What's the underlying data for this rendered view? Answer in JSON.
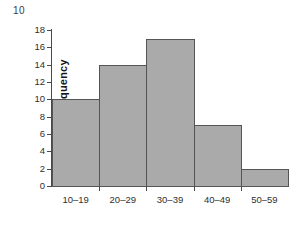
{
  "figure": {
    "number_label": "10",
    "background_color": "#ffffff"
  },
  "chart_data": {
    "type": "bar",
    "title": "",
    "subtitle": "",
    "xlabel": "",
    "ylabel": "Frequency",
    "categories": [
      "10–19",
      "20–29",
      "30–39",
      "40–49",
      "50–59"
    ],
    "values": [
      10,
      14,
      17,
      7,
      2
    ],
    "ylim": [
      0,
      18
    ],
    "yticks": [
      0,
      2,
      4,
      6,
      8,
      10,
      12,
      14,
      16,
      18
    ],
    "ytick_labels": [
      "0",
      "2",
      "4",
      "6",
      "8",
      "10",
      "12",
      "14",
      "16",
      "18"
    ],
    "grid": false,
    "legend": null,
    "legend_position": "none",
    "bar_fill_color": "#aaaaaa",
    "bar_edge_color": "#555555",
    "axis_color": "#4a4a4a",
    "bars_adjacent": true,
    "annotations": []
  }
}
